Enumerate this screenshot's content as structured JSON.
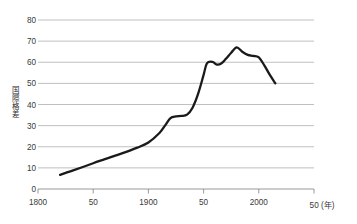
{
  "chart_data": {
    "type": "line",
    "title": "",
    "xlabel": "(年)",
    "ylabel": "国際格差",
    "xlim": [
      1800,
      2050
    ],
    "ylim": [
      0,
      80
    ],
    "grid": true,
    "legend": null,
    "y_ticks": [
      0,
      10,
      20,
      30,
      40,
      50,
      60,
      70,
      80
    ],
    "y_tick_labels": [
      "0",
      "10",
      "20",
      "30",
      "40",
      "50",
      "60",
      "70",
      "80"
    ],
    "x_ticks": [
      1800,
      1850,
      1900,
      1950,
      2000,
      2050
    ],
    "x_tick_labels": [
      "1800",
      "50",
      "1900",
      "50",
      "2000",
      "50 (年)"
    ],
    "series": [
      {
        "name": "国際格差",
        "color": "#1a1a1a",
        "x": [
          1820,
          1830,
          1840,
          1850,
          1860,
          1870,
          1880,
          1890,
          1900,
          1910,
          1915,
          1920,
          1925,
          1930,
          1935,
          1940,
          1945,
          1950,
          1953,
          1958,
          1962,
          1966,
          1970,
          1975,
          1980,
          1985,
          1990,
          1995,
          2000,
          2005,
          2010,
          2015
        ],
        "y": [
          6.7,
          8.5,
          10.3,
          12.2,
          14.0,
          15.8,
          17.6,
          19.6,
          22.0,
          26.5,
          30.0,
          33.6,
          34.4,
          34.6,
          35.2,
          38.5,
          45.0,
          54.0,
          59.5,
          60.2,
          58.9,
          59.4,
          61.5,
          64.5,
          67.0,
          65.0,
          63.5,
          63.0,
          62.3,
          58.5,
          54.0,
          50.0
        ]
      }
    ]
  }
}
